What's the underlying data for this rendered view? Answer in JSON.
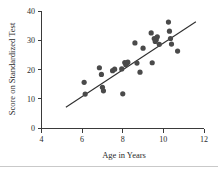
{
  "chart_data": {
    "type": "scatter",
    "title": "",
    "xlabel": "Age in Years",
    "ylabel": "Score on Standardized Test",
    "xlim": [
      4,
      12
    ],
    "ylim": [
      0,
      40
    ],
    "xticks": [
      4,
      6,
      8,
      10,
      12
    ],
    "yticks": [
      0,
      10,
      20,
      30,
      40
    ],
    "xtick_labels": [
      "4",
      "6",
      "8",
      "10",
      "12"
    ],
    "ytick_labels": [
      "0",
      "10",
      "20",
      "30",
      "40"
    ],
    "grid": false,
    "legend": null,
    "point_color": "#4a4a4a",
    "line_color": "#2e2e2e",
    "axis_color": "#3a3a3a",
    "points": [
      {
        "x": 6.1,
        "y": 15.6
      },
      {
        "x": 6.15,
        "y": 11.6
      },
      {
        "x": 6.85,
        "y": 20.6
      },
      {
        "x": 6.95,
        "y": 18.3
      },
      {
        "x": 7.0,
        "y": 13.9
      },
      {
        "x": 7.05,
        "y": 12.7
      },
      {
        "x": 7.5,
        "y": 19.6
      },
      {
        "x": 7.6,
        "y": 20.1
      },
      {
        "x": 7.95,
        "y": 20.2
      },
      {
        "x": 8.0,
        "y": 11.7
      },
      {
        "x": 8.1,
        "y": 22.4
      },
      {
        "x": 8.15,
        "y": 21.6
      },
      {
        "x": 8.2,
        "y": 22.1
      },
      {
        "x": 8.25,
        "y": 22.5
      },
      {
        "x": 8.6,
        "y": 29.1
      },
      {
        "x": 8.7,
        "y": 22.2
      },
      {
        "x": 8.85,
        "y": 19.1
      },
      {
        "x": 9.0,
        "y": 27.3
      },
      {
        "x": 9.4,
        "y": 32.5
      },
      {
        "x": 9.45,
        "y": 22.3
      },
      {
        "x": 9.55,
        "y": 30.6
      },
      {
        "x": 9.6,
        "y": 29.6
      },
      {
        "x": 9.65,
        "y": 30.2
      },
      {
        "x": 9.7,
        "y": 31.2
      },
      {
        "x": 9.8,
        "y": 28.6
      },
      {
        "x": 10.25,
        "y": 36.2
      },
      {
        "x": 10.3,
        "y": 33.1
      },
      {
        "x": 10.35,
        "y": 30.6
      },
      {
        "x": 10.4,
        "y": 28.7
      },
      {
        "x": 10.7,
        "y": 26.3
      }
    ],
    "fit_line": {
      "x_start": 5.2,
      "y_start": 7.1,
      "x_end": 11.6,
      "y_end": 36.3
    }
  }
}
